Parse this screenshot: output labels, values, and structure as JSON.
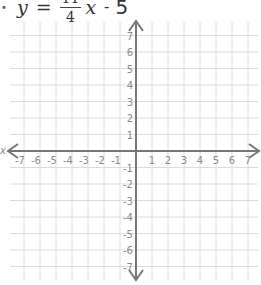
{
  "equation": {
    "bullet": "•",
    "lhs": "y",
    "equals": "=",
    "numerator": "11",
    "denominator": "4",
    "variable": "x",
    "operator": "-",
    "constant": "5"
  },
  "graph": {
    "x_axis_label": "x",
    "x_range": [
      -7,
      7
    ],
    "y_range": [
      -7,
      7
    ],
    "x_ticks": [
      "-7",
      "-6",
      "-5",
      "-4",
      "-3",
      "-2",
      "-1",
      "1",
      "2",
      "3",
      "4",
      "5",
      "6",
      "7"
    ],
    "y_ticks": [
      "7",
      "6",
      "5",
      "4",
      "3",
      "2",
      "1",
      "-1",
      "-2",
      "-3",
      "-4",
      "-5",
      "-6",
      "-7"
    ],
    "colors": {
      "grid": "#dcdcdc",
      "axis": "#777777",
      "tick_label": "#8a8a8a"
    }
  }
}
